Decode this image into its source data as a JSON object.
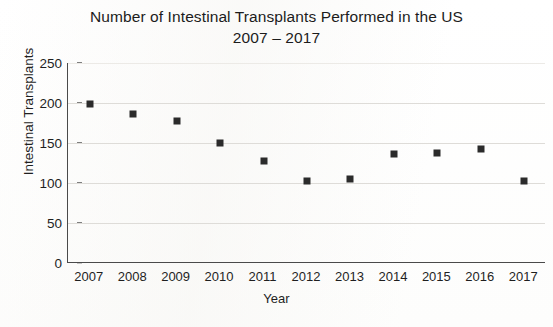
{
  "chart_data": {
    "type": "scatter",
    "title": "Number of Intestinal Transplants Performed in the US",
    "subtitle": "2007 – 2017",
    "xlabel": "Year",
    "ylabel": "Intestinal Transplants",
    "categories": [
      "2007",
      "2008",
      "2009",
      "2010",
      "2011",
      "2012",
      "2013",
      "2014",
      "2015",
      "2016",
      "2017"
    ],
    "x": [
      2007,
      2008,
      2009,
      2010,
      2011,
      2012,
      2013,
      2014,
      2015,
      2016,
      2017
    ],
    "values": [
      199,
      186,
      178,
      150,
      127,
      103,
      105,
      136,
      137,
      143,
      103
    ],
    "ylim": [
      0,
      250
    ],
    "yticks": [
      0,
      50,
      100,
      150,
      200,
      250
    ],
    "ytick_labels": [
      "0",
      "50",
      "100",
      "150",
      "200",
      "250"
    ],
    "grid": true,
    "legend": "none",
    "marker": "square",
    "marker_color": "#2b2b2b",
    "series": [
      {
        "name": "Intestinal Transplants",
        "values": [
          199,
          186,
          178,
          150,
          127,
          103,
          105,
          136,
          137,
          143,
          103
        ]
      }
    ]
  }
}
